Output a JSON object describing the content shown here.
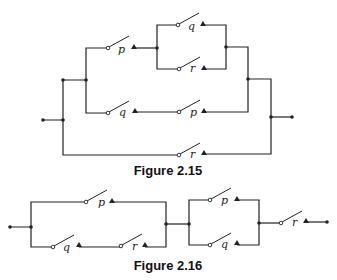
{
  "figures": [
    {
      "caption": "Figure 2.15",
      "switches": [
        {
          "label": "p",
          "branch": "upper-series"
        },
        {
          "label": "q",
          "branch": "upper-parallel-top"
        },
        {
          "label": "r",
          "branch": "upper-parallel-bottom"
        },
        {
          "label": "q",
          "branch": "middle-series-1"
        },
        {
          "label": "p",
          "branch": "middle-series-2"
        },
        {
          "label": "r",
          "branch": "outer-bypass"
        }
      ]
    },
    {
      "caption": "Figure 2.16",
      "switches": [
        {
          "label": "p",
          "branch": "block1-top"
        },
        {
          "label": "q",
          "branch": "block1-bottom-1"
        },
        {
          "label": "r",
          "branch": "block1-bottom-2"
        },
        {
          "label": "p",
          "branch": "block2-top"
        },
        {
          "label": "q",
          "branch": "block2-bottom"
        },
        {
          "label": "r",
          "branch": "output-series"
        }
      ]
    }
  ]
}
